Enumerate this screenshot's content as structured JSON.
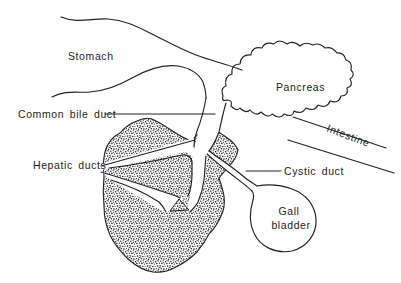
{
  "diagram": {
    "type": "anatomical-line-diagram",
    "labels": {
      "stomach": "Stomach",
      "pancreas": "Pancreas",
      "common_bile_duct": "Common bile duct",
      "hepatic_ducts": "Hepatic ducts",
      "cystic_duct": "Cystic duct",
      "gall_bladder_line1": "Gall",
      "gall_bladder_line2": "bladder",
      "intestine": "Intestine"
    },
    "colors": {
      "line": "#222222",
      "text": "#1c1c1c",
      "background": "#ffffff",
      "stipple": "#1a1a1a"
    }
  }
}
